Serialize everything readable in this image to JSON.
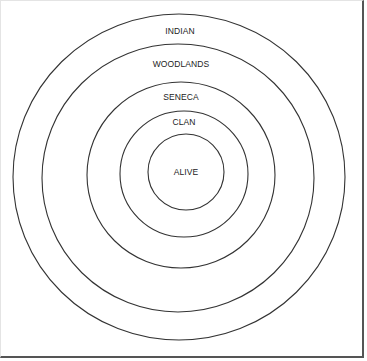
{
  "diagram": {
    "type": "concentric-circles",
    "stroke_color": "#333333",
    "rings": [
      {
        "label": "INDIAN",
        "cx": 179,
        "cy": 177,
        "rx": 166,
        "ry": 163,
        "label_x": 180,
        "label_y": 31
      },
      {
        "label": "WOODLANDS",
        "cx": 178,
        "cy": 178,
        "rx": 136,
        "ry": 134,
        "label_x": 181,
        "label_y": 64
      },
      {
        "label": "SENECA",
        "cx": 181,
        "cy": 175,
        "rx": 94,
        "ry": 93,
        "label_x": 181,
        "label_y": 97
      },
      {
        "label": "CLAN",
        "cx": 184,
        "cy": 174,
        "rx": 64,
        "ry": 63,
        "label_x": 184,
        "label_y": 122
      },
      {
        "label": "ALIVE",
        "cx": 186,
        "cy": 172,
        "rx": 38,
        "ry": 38,
        "label_x": 186,
        "label_y": 172
      }
    ]
  }
}
